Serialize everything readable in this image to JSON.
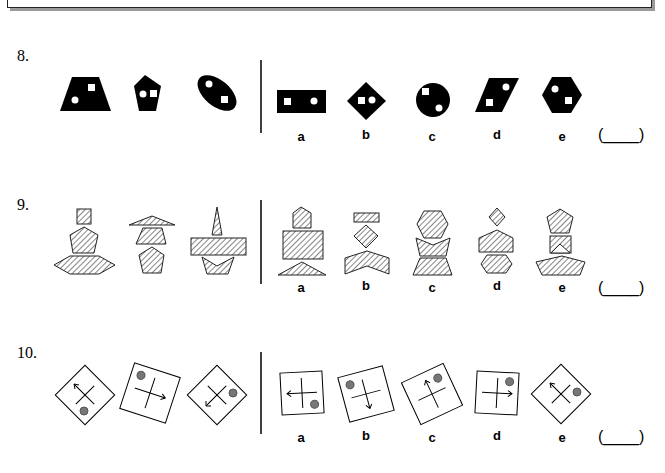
{
  "questions": [
    {
      "number": "8.",
      "description": "Black shapes each containing one white circle and one white square",
      "question_figures": [
        "trapezoid",
        "pentagon",
        "tilted-ellipse"
      ],
      "options": [
        {
          "label": "a",
          "shape": "rectangle"
        },
        {
          "label": "b",
          "shape": "diamond"
        },
        {
          "label": "c",
          "shape": "circle"
        },
        {
          "label": "d",
          "shape": "parallelogram"
        },
        {
          "label": "e",
          "shape": "hexagon"
        }
      ],
      "answer_blank": "(____)"
    },
    {
      "number": "9.",
      "description": "Stacks of three hatched shapes",
      "question_figures": [
        "square-pentagon-hexagon",
        "triangle-trapezoid-pentagon",
        "spike-bar-chevron"
      ],
      "options": [
        {
          "label": "a",
          "shape": "house-rectangle-triangle"
        },
        {
          "label": "b",
          "shape": "bar-diamond-chevron"
        },
        {
          "label": "c",
          "shape": "hexagon-chevron-trapezoid"
        },
        {
          "label": "d",
          "shape": "diamond-trapezoid-hexagon"
        },
        {
          "label": "e",
          "shape": "pentagon-notched-square-flat-pentagon"
        }
      ],
      "answer_blank": "(____)"
    },
    {
      "number": "10.",
      "description": "Rotated squares with a cross, an arrow and a grey dot",
      "question_figures": [
        "diamond-arrow-up-left",
        "tilted-arrow-right",
        "diamond-arrow-down-left"
      ],
      "options": [
        {
          "label": "a",
          "shape": "square-arrow-left"
        },
        {
          "label": "b",
          "shape": "tilted-arrow-down"
        },
        {
          "label": "c",
          "shape": "tilted-arrow-up"
        },
        {
          "label": "d",
          "shape": "square-arrow-right"
        },
        {
          "label": "e",
          "shape": "diamond-arrow-up-left"
        }
      ],
      "answer_blank": "(____)"
    }
  ],
  "colors": {
    "ink": "#000000",
    "dot": "#777777",
    "hatch_stroke": "#333333"
  }
}
